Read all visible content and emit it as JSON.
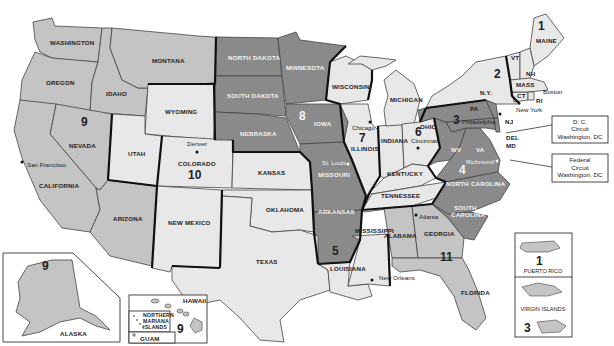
{
  "colors": {
    "light": "#e8e8e8",
    "medium": "#c4c4c4",
    "dark": "#8a8a8a",
    "circuit_border": "#111111",
    "state_border": "#444444"
  },
  "states": {
    "washington": "WASHINGTON",
    "oregon": "OREGON",
    "idaho": "IDAHO",
    "montana": "MONTANA",
    "nevada": "NEVADA",
    "california": "CALIFORNIA",
    "arizona": "ARIZONA",
    "wyoming": "WYOMING",
    "utah": "UTAH",
    "colorado": "COLORADO",
    "new_mexico": "NEW MEXICO",
    "kansas": "KANSAS",
    "oklahoma": "OKLAHOMA",
    "north_dakota": "NORTH DAKOTA",
    "south_dakota": "SOUTH DAKOTA",
    "nebraska": "NEBRASKA",
    "minnesota": "MINNESOTA",
    "iowa": "IOWA",
    "missouri": "MISSOURI",
    "arkansas": "ARKANSAS",
    "texas": "TEXAS",
    "louisiana": "LOUISIANA",
    "mississippi": "MISSISSIPPI",
    "wisconsin": "WISCONSIN",
    "illinois": "ILLINOIS",
    "indiana": "INDIANA",
    "michigan": "MICHIGAN",
    "ohio": "OHIO",
    "kentucky": "KENTUCKY",
    "tennessee": "TENNESSEE",
    "alabama": "ALABAMA",
    "georgia": "GEORGIA",
    "florida": "FLORIDA",
    "south_carolina": "SOUTH CAROLINA",
    "north_carolina": "NORTH CAROLINA",
    "virginia": "VA",
    "west_virginia": "WV",
    "pennsylvania": "PA",
    "new_jersey": "NJ",
    "delaware": "DEL",
    "maryland": "MD",
    "new_york": "N.Y.",
    "vermont": "VT",
    "new_hampshire": "NH",
    "maine": "MAINE",
    "massachusetts": "MASS",
    "connecticut": "CT",
    "rhode_island": "RI",
    "alaska": "ALASKA",
    "hawaii": "HAWAII",
    "northern_mariana": [
      "NORTHERN",
      "MARIANA",
      "ISLANDS"
    ],
    "guam": "GUAM",
    "puerto_rico": "PUERTO RICO",
    "virgin_islands": "VIRGIN ISLANDS"
  },
  "circuits": {
    "c1": "1",
    "c2": "2",
    "c3": "3",
    "c4": "4",
    "c5": "5",
    "c6": "6",
    "c7": "7",
    "c8": "8",
    "c9": "9",
    "c10": "10",
    "c11": "11",
    "alaska": "9",
    "hawaii": "9",
    "puerto_rico": "1",
    "virgin_islands": "3"
  },
  "cities": {
    "san_francisco": "San Francisco",
    "denver": "Denver",
    "st_louis": "St. Louis",
    "chicago": "Chicago",
    "cincinnati": "Cincinnati",
    "philadelphia": "Philadelphia",
    "new_york": "New York",
    "boston": "Boston",
    "richmond": "Richmond",
    "atlanta": "Atlanta",
    "new_orleans": "New Orleans"
  },
  "callouts": {
    "dc": [
      "D. C.",
      "Circuit",
      "Washington, DC"
    ],
    "federal": [
      "Federal",
      "Circuit",
      "Washington, DC"
    ]
  }
}
